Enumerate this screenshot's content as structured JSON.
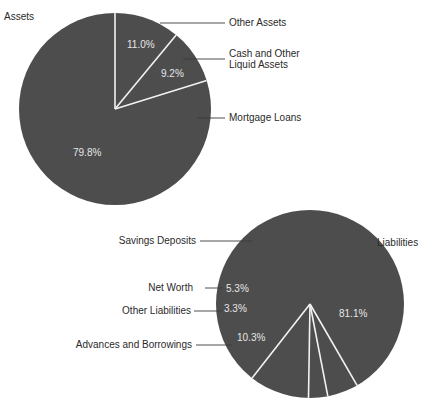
{
  "chart_data": [
    {
      "type": "pie",
      "title": "Assets",
      "slices": [
        {
          "label": "Other Assets",
          "value": 11.0,
          "display": "11.0%"
        },
        {
          "label": "Cash and Other Liquid Assets",
          "label_lines": [
            "Cash and Other",
            "Liquid Assets"
          ],
          "value": 9.2,
          "display": "9.2%"
        },
        {
          "label": "Mortgage Loans",
          "value": 79.8,
          "display": "79.8%"
        }
      ],
      "start_angle_deg": 0,
      "direction": "clockwise",
      "legend_position": "right (leader lines)"
    },
    {
      "type": "pie",
      "title": "Liabilities",
      "slices": [
        {
          "label": "Savings Deposits",
          "value": 81.1,
          "display": "81.1%"
        },
        {
          "label": "Net Worth",
          "value": 5.3,
          "display": "5.3%"
        },
        {
          "label": "Other Liabilities",
          "value": 3.3,
          "display": "3.3%"
        },
        {
          "label": "Advances and Borrowings",
          "value": 10.3,
          "display": "10.3%"
        }
      ],
      "legend_position": "left (leader lines)"
    }
  ],
  "colors": {
    "slice_fill": "#4d4d4d",
    "separator": "#f2f2f2",
    "text": "#2a2a2a",
    "pct_text": "#e6e6e6",
    "leader_line": "#3a3a3a"
  }
}
